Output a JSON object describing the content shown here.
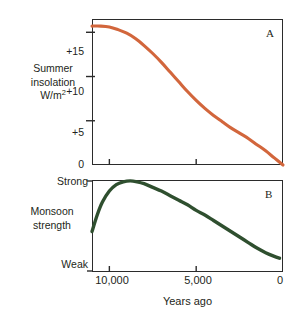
{
  "figure": {
    "background_color": "#ffffff",
    "panel_letters": {
      "a": "A",
      "b": "B"
    }
  },
  "axes": {
    "shared_x": {
      "title": "Years ago",
      "tick_labels": [
        "10,000",
        "5,000",
        "0"
      ],
      "tick_values": [
        10000,
        5000,
        0
      ],
      "direction": "reversed"
    },
    "panel_a_y": {
      "label_line1": "Summer",
      "label_line2": "insolation",
      "label_line3_base": "W/m",
      "label_line3_sup": "2",
      "tick_labels": [
        "+15",
        "+10",
        "+5",
        "0"
      ],
      "tick_values": [
        15,
        10,
        5,
        0
      ]
    },
    "panel_b_y": {
      "label_line1": "Monsoon",
      "label_line2": "strength",
      "tick_labels": [
        "Strong",
        "Weak"
      ]
    }
  },
  "chart_data": [
    {
      "type": "line",
      "title": "A",
      "xlabel": "Years ago",
      "ylabel": "Summer insolation W/m2",
      "xlim": [
        11000,
        0
      ],
      "ylim": [
        0,
        16.5
      ],
      "x_reversed": true,
      "grid": false,
      "legend": "none",
      "series_color": "#d2663c",
      "series": [
        {
          "name": "Summer insolation",
          "x": [
            11000,
            10500,
            10000,
            9500,
            9000,
            8500,
            8000,
            7500,
            7000,
            6500,
            6000,
            5500,
            5000,
            4500,
            4000,
            3500,
            3000,
            2500,
            2000,
            1500,
            1000,
            500,
            0
          ],
          "values": [
            15.7,
            15.7,
            15.6,
            15.3,
            14.9,
            14.3,
            13.5,
            12.6,
            11.6,
            10.5,
            9.4,
            8.3,
            7.3,
            6.4,
            5.6,
            4.9,
            4.2,
            3.6,
            3.0,
            2.3,
            1.6,
            0.8,
            0.0
          ]
        }
      ]
    },
    {
      "type": "line",
      "title": "B",
      "xlabel": "Years ago",
      "ylabel": "Monsoon strength",
      "xlim": [
        11000,
        0
      ],
      "ylim": [
        0,
        1
      ],
      "x_reversed": true,
      "grid": false,
      "legend": "none",
      "series_color": "#2f4f2f",
      "y_tick_labels": [
        "Strong",
        "Weak"
      ],
      "series": [
        {
          "name": "Monsoon strength",
          "x": [
            11000,
            10700,
            10400,
            10000,
            9600,
            9200,
            8800,
            8400,
            8000,
            7500,
            7000,
            6500,
            6000,
            5500,
            5000,
            4500,
            4000,
            3500,
            3000,
            2500,
            2000,
            1500,
            1000,
            500,
            200
          ],
          "values": [
            0.44,
            0.62,
            0.76,
            0.88,
            0.95,
            0.98,
            0.99,
            0.98,
            0.96,
            0.92,
            0.88,
            0.83,
            0.78,
            0.73,
            0.67,
            0.62,
            0.56,
            0.5,
            0.44,
            0.38,
            0.32,
            0.26,
            0.21,
            0.17,
            0.15
          ]
        }
      ]
    }
  ]
}
